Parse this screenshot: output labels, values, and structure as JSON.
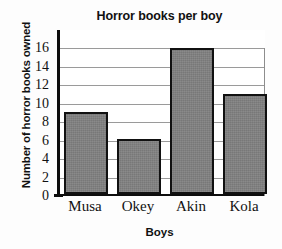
{
  "chart_data": {
    "type": "bar",
    "title": "Horror books per boy",
    "xlabel": "Boys",
    "ylabel": "Number of horror books owned",
    "categories": [
      "Musa",
      "Okey",
      "Akin",
      "Kola"
    ],
    "values": [
      9,
      6,
      16,
      11
    ],
    "ylim": [
      0,
      17
    ],
    "yticks": [
      0,
      2,
      4,
      6,
      8,
      10,
      12,
      14,
      16
    ],
    "ytick_labels": [
      "0",
      "2",
      "4",
      "6",
      "8",
      "10",
      "12",
      "14",
      "16"
    ],
    "grid": "horizontal",
    "legend": "none",
    "bar_fill_color": "#808080",
    "bar_edge_color": "#111111",
    "gridline_color": "#9a9a9a",
    "axis_color": "#0d0d0d",
    "background_color": "#ffffff"
  }
}
